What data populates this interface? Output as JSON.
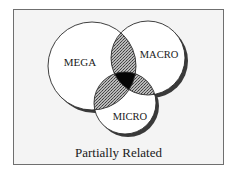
{
  "diagram": {
    "type": "venn",
    "caption": "Partially Related",
    "sets": [
      {
        "id": "mega",
        "label": "MEGA",
        "cx": 92,
        "cy": 66,
        "r": 44
      },
      {
        "id": "macro",
        "label": "MACRO",
        "cx": 148,
        "cy": 58,
        "r": 37
      },
      {
        "id": "micro",
        "label": "MICRO",
        "cx": 125,
        "cy": 103,
        "r": 31
      }
    ],
    "labels": {
      "mega": "MEGA",
      "macro": "MACRO",
      "micro": "MICRO"
    },
    "styles": {
      "pairwise_overlap": "crosshatch-gray",
      "triple_overlap": "black",
      "circle_fill": "#ffffff",
      "outline_color": "#2a2a2a",
      "shadow_color": "#3a3a3a",
      "frame_background": "#f4f4f4",
      "frame_border": "#6f6f6f"
    }
  }
}
